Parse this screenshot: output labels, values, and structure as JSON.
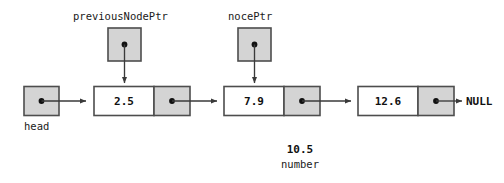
{
  "diagram": {
    "colors": {
      "stroke": "#4d4d4d",
      "gray_fill": "#d4d4d4",
      "white_fill": "#ffffff",
      "text": "#111111",
      "arrow": "#3a3a3a"
    },
    "head_pointer": {
      "label": "head",
      "has_dot": true
    },
    "pointers": [
      {
        "label": "previousNodePtr",
        "targets_node_index": 0,
        "has_dot": true
      },
      {
        "label": "nocePtr",
        "targets_node_index": 1,
        "has_dot": true
      }
    ],
    "nodes": [
      {
        "value": "2.5",
        "next_dot": true
      },
      {
        "value": "7.9",
        "next_dot": true
      },
      {
        "value": "12.6",
        "next_dot": true
      }
    ],
    "terminator": "NULL",
    "annotation": {
      "value": "10.5",
      "caption": "number"
    }
  }
}
